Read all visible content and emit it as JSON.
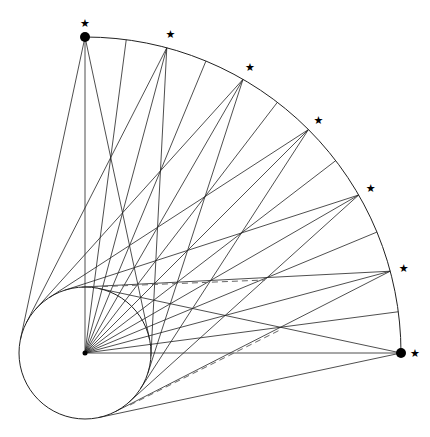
{
  "diagram": {
    "title": "",
    "center": [
      85,
      353
    ],
    "big_radius": 316,
    "small_radius": 66,
    "arc_start_deg": 0,
    "arc_end_deg": 90,
    "radial_step_deg": 7.5,
    "marked_points_deg": [
      0,
      15,
      30,
      45,
      60,
      75,
      90
    ],
    "large_dots_deg": [
      0,
      90
    ],
    "marker_glyph": "★",
    "dashed_lines": [
      {
        "from": [
          92,
          287
        ],
        "to": [
          265,
          280
        ]
      },
      {
        "from": [
          130,
          405
        ],
        "to": [
          280,
          330
        ]
      }
    ],
    "stroke_color": "#222222",
    "dash_color": "#666666"
  }
}
